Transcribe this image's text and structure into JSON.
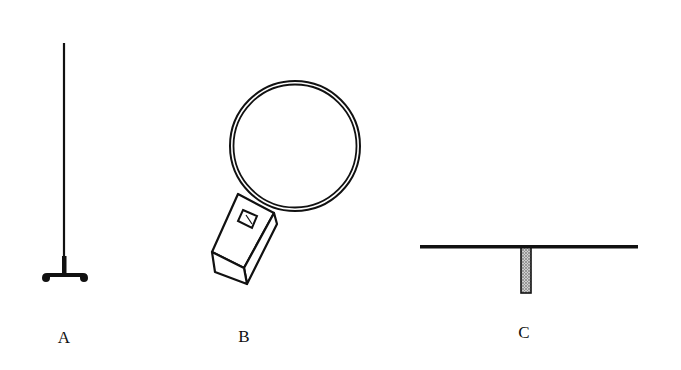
{
  "figure": {
    "background": "#ffffff",
    "ink_color": "#111111",
    "items": [
      {
        "id": "A",
        "label": "A",
        "description": "vertical antenna rod on tripod stand",
        "icon": "vertical-rod-antenna-icon"
      },
      {
        "id": "B",
        "label": "B",
        "description": "loop antenna ring attached to handheld meter box",
        "icon": "loop-antenna-meter-icon"
      },
      {
        "id": "C",
        "label": "C",
        "description": "horizontal dipole bar with stippled vertical feed stem",
        "icon": "dipole-antenna-icon"
      }
    ]
  }
}
